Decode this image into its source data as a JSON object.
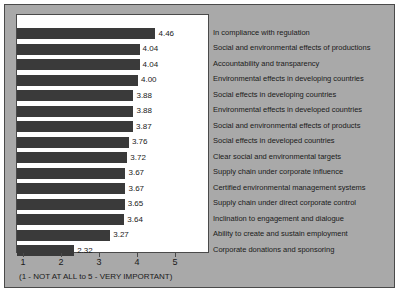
{
  "chart_data": {
    "type": "bar",
    "orientation": "horizontal",
    "title": "",
    "xlabel": "(1 - NOT AT ALL to 5 - VERY IMPORTANT)",
    "ylabel": "",
    "xlim": [
      0,
      5
    ],
    "xticks": [
      1,
      2,
      3,
      4,
      5
    ],
    "xticklabels": [
      "1",
      "2",
      "3",
      "4",
      "5"
    ],
    "grid": false,
    "legend": null,
    "bar_color": "#3a3a3a",
    "panel_color": "#a9a9a9",
    "plot_background": "#ffffff",
    "categories": [
      "In compliance with regulation",
      "Social and environmental effects of productions",
      "Accountability and transparency",
      "Environmental effects in developing countries",
      "Social effects in developing countries",
      "Environmental effects in developed countries",
      "Social and environmental effects of products",
      "Social effects in developed countries",
      "Clear social and environmental targets",
      "Supply chain under corporate influence",
      "Certified environmental management systems",
      "Supply chain under direct corporate control",
      "Inclination to engagement and dialogue",
      "Ability to create and sustain employment",
      "Corporate donations and sponsoring"
    ],
    "values": [
      4.46,
      4.04,
      4.04,
      4.0,
      3.88,
      3.88,
      3.87,
      3.76,
      3.72,
      3.67,
      3.67,
      3.65,
      3.64,
      3.27,
      2.32
    ],
    "value_labels": [
      "4.46",
      "4.04",
      "4.04",
      "4.00",
      "3.88",
      "3.88",
      "3.87",
      "3.76",
      "3.72",
      "3.67",
      "3.67",
      "3.65",
      "3.64",
      "3.27",
      "2.32"
    ]
  }
}
